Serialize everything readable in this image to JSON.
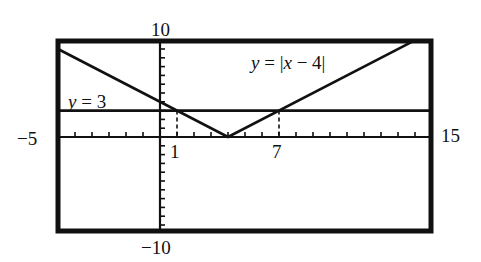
{
  "chart_data": {
    "type": "line",
    "title": "",
    "xlabel": "",
    "ylabel": "",
    "xlim": [
      -5,
      15
    ],
    "ylim": [
      -10,
      10
    ],
    "grid": false,
    "legend": null,
    "tick_labels": {
      "xmin": "−5",
      "xmax": "15",
      "ymax": "10",
      "ymin": "−10"
    },
    "x_tick_step": 1,
    "y_tick_step": 1,
    "series": [
      {
        "name": "y = |x − 4|",
        "label_parts": [
          "y",
          " = |",
          "x",
          " − 4|"
        ],
        "points": [
          [
            -6,
            10
          ],
          [
            4,
            0
          ],
          [
            14.9,
            10.9
          ]
        ]
      },
      {
        "name": "y = 3",
        "label_parts": [
          "y",
          " = 3"
        ],
        "points": [
          [
            -6.1,
            3
          ],
          [
            15.9,
            3
          ]
        ]
      }
    ],
    "intersections": [
      {
        "x": 1,
        "y": 3,
        "label": "1"
      },
      {
        "x": 7,
        "y": 3,
        "label": "7"
      }
    ],
    "annotations": [
      "dashed vertical lines from intersection points down to the x-axis at x = 1 and x = 7"
    ]
  }
}
